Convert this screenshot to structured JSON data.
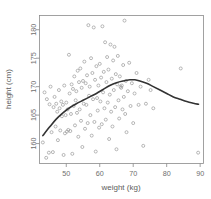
{
  "chart_data": {
    "type": "scatter",
    "title": "",
    "xlabel": "weight (kg)",
    "ylabel": "height (cm)",
    "xlim": [
      42,
      91
    ],
    "ylim": [
      156.5,
      182.5
    ],
    "xticks": [
      50,
      60,
      70,
      80,
      90
    ],
    "xtick_labels": [
      "50",
      "60",
      "70",
      "80",
      "90"
    ],
    "yticks": [
      160,
      165,
      170,
      175,
      180
    ],
    "ytick_labels": [
      "160",
      "165",
      "170",
      "175",
      "180"
    ],
    "grid": false,
    "legend": "none",
    "marker": "open-circle",
    "marker_color": "#9a9a9a",
    "curve_color": "#333333",
    "frame_color": "#8a8a8a",
    "series": [
      {
        "name": "observations",
        "points": [
          [
            43.0,
            160.2
          ],
          [
            43.5,
            169.0
          ],
          [
            44.0,
            157.5
          ],
          [
            44.2,
            167.8
          ],
          [
            44.8,
            158.4
          ],
          [
            45.0,
            166.9
          ],
          [
            45.3,
            170.0
          ],
          [
            45.6,
            162.0
          ],
          [
            46.0,
            158.5
          ],
          [
            46.2,
            166.4
          ],
          [
            46.5,
            168.2
          ],
          [
            46.8,
            163.0
          ],
          [
            47.0,
            167.0
          ],
          [
            47.3,
            165.6
          ],
          [
            47.5,
            160.6
          ],
          [
            47.8,
            169.4
          ],
          [
            48.0,
            166.2
          ],
          [
            48.2,
            162.3
          ],
          [
            48.5,
            167.4
          ],
          [
            48.7,
            164.8
          ],
          [
            49.0,
            166.8
          ],
          [
            49.2,
            158.0
          ],
          [
            49.4,
            170.2
          ],
          [
            49.6,
            161.8
          ],
          [
            49.8,
            165.0
          ],
          [
            50.0,
            167.2
          ],
          [
            50.2,
            162.1
          ],
          [
            50.4,
            166.0
          ],
          [
            50.6,
            162.4
          ],
          [
            50.8,
            175.6
          ],
          [
            51.0,
            168.8
          ],
          [
            51.2,
            162.2
          ],
          [
            51.4,
            165.2
          ],
          [
            51.6,
            170.4
          ],
          [
            51.8,
            158.2
          ],
          [
            52.0,
            169.6
          ],
          [
            52.2,
            166.6
          ],
          [
            52.4,
            171.8
          ],
          [
            52.6,
            163.2
          ],
          [
            52.8,
            167.6
          ],
          [
            53.0,
            169.2
          ],
          [
            53.2,
            165.4
          ],
          [
            53.4,
            172.8
          ],
          [
            53.6,
            161.2
          ],
          [
            53.8,
            170.8
          ],
          [
            54.0,
            166.0
          ],
          [
            54.2,
            173.2
          ],
          [
            54.4,
            164.0
          ],
          [
            54.6,
            169.8
          ],
          [
            54.8,
            159.4
          ],
          [
            55.0,
            171.0
          ],
          [
            55.2,
            167.0
          ],
          [
            55.4,
            174.4
          ],
          [
            55.6,
            162.6
          ],
          [
            55.8,
            170.6
          ],
          [
            56.0,
            166.8
          ],
          [
            56.2,
            172.0
          ],
          [
            56.4,
            163.6
          ],
          [
            56.6,
            180.8
          ],
          [
            56.8,
            168.4
          ],
          [
            57.0,
            170.0
          ],
          [
            57.2,
            165.0
          ],
          [
            57.4,
            175.0
          ],
          [
            57.6,
            161.4
          ],
          [
            57.8,
            172.4
          ],
          [
            58.0,
            167.8
          ],
          [
            58.2,
            180.4
          ],
          [
            58.4,
            163.8
          ],
          [
            58.6,
            171.2
          ],
          [
            58.8,
            158.6
          ],
          [
            59.0,
            173.6
          ],
          [
            59.2,
            168.0
          ],
          [
            59.4,
            165.8
          ],
          [
            59.6,
            170.2
          ],
          [
            59.8,
            162.8
          ],
          [
            60.0,
            174.0
          ],
          [
            60.2,
            167.4
          ],
          [
            60.4,
            171.6
          ],
          [
            60.6,
            163.4
          ],
          [
            60.8,
            180.6
          ],
          [
            61.0,
            169.0
          ],
          [
            61.2,
            172.6
          ],
          [
            61.4,
            166.2
          ],
          [
            61.6,
            177.8
          ],
          [
            61.8,
            164.2
          ],
          [
            62.0,
            170.8
          ],
          [
            62.2,
            175.2
          ],
          [
            62.4,
            167.2
          ],
          [
            62.6,
            173.0
          ],
          [
            62.8,
            160.8
          ],
          [
            63.0,
            168.6
          ],
          [
            63.2,
            177.4
          ],
          [
            63.4,
            165.6
          ],
          [
            63.6,
            171.4
          ],
          [
            63.8,
            163.0
          ],
          [
            64.0,
            174.6
          ],
          [
            64.2,
            169.4
          ],
          [
            64.4,
            177.0
          ],
          [
            64.6,
            166.4
          ],
          [
            64.8,
            172.2
          ],
          [
            65.0,
            159.0
          ],
          [
            65.2,
            170.4
          ],
          [
            65.4,
            175.4
          ],
          [
            65.6,
            167.6
          ],
          [
            65.8,
            164.4
          ],
          [
            66.0,
            171.8
          ],
          [
            66.2,
            170.0
          ],
          [
            66.4,
            169.8
          ],
          [
            66.6,
            170.2
          ],
          [
            66.8,
            166.0
          ],
          [
            67.0,
            173.8
          ],
          [
            67.2,
            168.2
          ],
          [
            67.4,
            181.6
          ],
          [
            67.6,
            165.2
          ],
          [
            67.8,
            171.0
          ],
          [
            68.0,
            162.0
          ],
          [
            68.4,
            169.2
          ],
          [
            68.8,
            174.2
          ],
          [
            69.2,
            166.6
          ],
          [
            69.6,
            170.6
          ],
          [
            70.0,
            163.6
          ],
          [
            70.4,
            168.8
          ],
          [
            71.0,
            172.4
          ],
          [
            71.6,
            166.8
          ],
          [
            72.2,
            170.0
          ],
          [
            73.0,
            159.6
          ],
          [
            73.8,
            167.0
          ],
          [
            74.6,
            171.2
          ],
          [
            75.2,
            169.4
          ],
          [
            76.0,
            166.2
          ],
          [
            84.2,
            173.2
          ],
          [
            89.4,
            158.4
          ]
        ]
      }
    ],
    "smooth": {
      "name": "lowess",
      "points": [
        [
          43.0,
          161.4
        ],
        [
          45.0,
          162.9
        ],
        [
          47.0,
          164.3
        ],
        [
          49.0,
          165.4
        ],
        [
          51.0,
          166.3
        ],
        [
          53.0,
          167.0
        ],
        [
          55.0,
          167.6
        ],
        [
          57.0,
          168.2
        ],
        [
          59.0,
          168.8
        ],
        [
          61.0,
          169.5
        ],
        [
          63.0,
          170.2
        ],
        [
          65.0,
          170.7
        ],
        [
          67.0,
          171.0
        ],
        [
          69.0,
          171.2
        ],
        [
          70.5,
          171.2
        ],
        [
          72.0,
          171.0
        ],
        [
          74.0,
          170.6
        ],
        [
          76.0,
          170.0
        ],
        [
          78.0,
          169.4
        ],
        [
          80.0,
          168.8
        ],
        [
          82.0,
          168.2
        ],
        [
          84.0,
          167.8
        ],
        [
          86.0,
          167.4
        ],
        [
          88.0,
          167.1
        ],
        [
          89.5,
          166.9
        ]
      ]
    }
  }
}
